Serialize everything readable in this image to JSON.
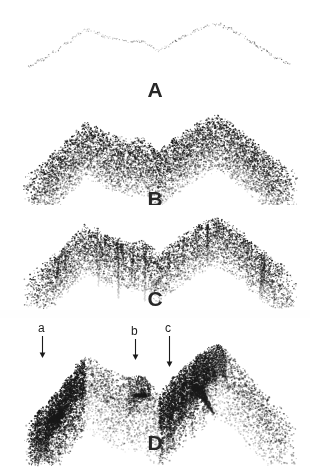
{
  "figure": {
    "background_color": "#ffffff",
    "ink_color": "#1a1a1a",
    "width": 310,
    "height": 467,
    "panels": [
      {
        "id": "A",
        "letter": "A",
        "letter_x": 155,
        "letter_y": 79,
        "top": 0,
        "height": 100,
        "style": "sparse-outline",
        "density": 0.06,
        "dot_size": [
          0.6,
          1.3
        ],
        "band_thickness": 3,
        "opacity": 0.55,
        "description": "Faint sparse dotted outline of a two-peak ridge profile"
      },
      {
        "id": "B",
        "letter": "B",
        "letter_x": 155,
        "letter_y": 188,
        "top": 100,
        "height": 108,
        "style": "stipple-fill",
        "density": 0.55,
        "dot_size": [
          0.8,
          2.1
        ],
        "band_thickness": 58,
        "opacity": 0.95,
        "description": "Dense stipple fill below the ridge fading downward"
      },
      {
        "id": "C",
        "letter": "C",
        "letter_x": 155,
        "letter_y": 288,
        "top": 205,
        "height": 105,
        "style": "stipple-streaked",
        "density": 0.5,
        "dot_size": [
          0.8,
          2.0
        ],
        "band_thickness": 52,
        "opacity": 0.95,
        "streaks": 26,
        "description": "Stipple fill with vertical downward streaks in the valleys"
      },
      {
        "id": "D",
        "letter": "D",
        "letter_x": 155,
        "letter_y": 432,
        "top": 318,
        "height": 149,
        "style": "wedge-shaded",
        "density": 0.72,
        "dot_size": [
          0.9,
          2.3
        ],
        "band_thickness": 78,
        "opacity": 1.0,
        "description": "Heavily shaded asymmetric wedges with dark upper-left faces"
      }
    ],
    "profile": {
      "x_start": 28,
      "x_end": 292,
      "peak1_x": 86,
      "peak2_x": 216,
      "valley_x": 152,
      "nodes": [
        [
          28,
          0.1
        ],
        [
          42,
          0.26
        ],
        [
          56,
          0.44
        ],
        [
          68,
          0.62
        ],
        [
          78,
          0.78
        ],
        [
          86,
          0.88
        ],
        [
          96,
          0.82
        ],
        [
          108,
          0.72
        ],
        [
          120,
          0.66
        ],
        [
          132,
          0.62
        ],
        [
          142,
          0.64
        ],
        [
          150,
          0.56
        ],
        [
          158,
          0.44
        ],
        [
          166,
          0.52
        ],
        [
          176,
          0.66
        ],
        [
          188,
          0.78
        ],
        [
          200,
          0.9
        ],
        [
          210,
          0.97
        ],
        [
          218,
          1.0
        ],
        [
          228,
          0.92
        ],
        [
          240,
          0.78
        ],
        [
          252,
          0.62
        ],
        [
          264,
          0.46
        ],
        [
          276,
          0.3
        ],
        [
          292,
          0.14
        ]
      ]
    },
    "arrows": [
      {
        "name": "arrow-a",
        "label": "a",
        "label_x": 38,
        "label_y": 322,
        "line_x": 42,
        "line_top": 336,
        "line_bottom": 358,
        "length": 22
      },
      {
        "name": "arrow-b",
        "label": "b",
        "label_x": 131,
        "label_y": 325,
        "line_x": 135,
        "line_top": 339,
        "line_bottom": 360,
        "length": 21
      },
      {
        "name": "arrow-c",
        "label": "c",
        "label_x": 165,
        "label_y": 322,
        "line_x": 169,
        "line_top": 336,
        "line_bottom": 367,
        "length": 31
      }
    ]
  }
}
